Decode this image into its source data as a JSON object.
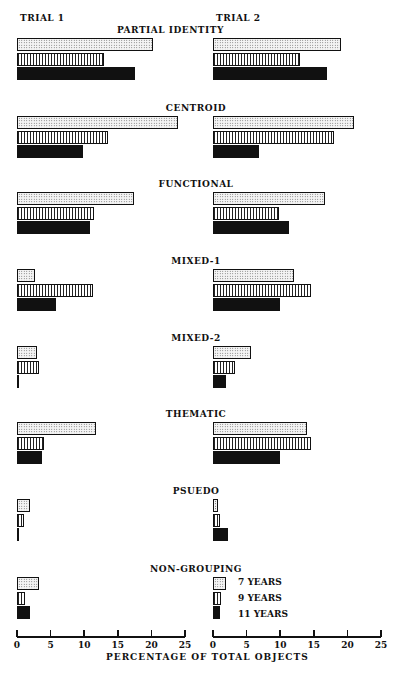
{
  "chart_data": {
    "type": "bar",
    "orientation": "horizontal",
    "panels": [
      "TRIAL 1",
      "TRIAL 2"
    ],
    "categories": [
      "PARTIAL IDENTITY",
      "CENTROID",
      "FUNCTIONAL",
      "MIXED-1",
      "MIXED-2",
      "THEMATIC",
      "PSUEDO",
      "NON-GROUPING"
    ],
    "series": [
      {
        "name": "7 YEARS",
        "pattern": "dotted",
        "trial1": [
          20.2,
          24.0,
          17.4,
          2.7,
          3.0,
          11.7,
          2.0,
          3.2
        ],
        "trial2": [
          19.0,
          21.0,
          16.7,
          12.0,
          5.6,
          14.0,
          0.8,
          2.0
        ]
      },
      {
        "name": "9 YEARS",
        "pattern": "vertical-lines",
        "trial1": [
          13.0,
          13.5,
          11.4,
          11.3,
          3.2,
          4.0,
          1.0,
          1.2
        ],
        "trial2": [
          13.0,
          18.0,
          9.8,
          14.6,
          3.2,
          14.6,
          1.0,
          1.2
        ]
      },
      {
        "name": "11 YEARS",
        "pattern": "solid-black",
        "trial1": [
          17.5,
          9.8,
          10.9,
          5.8,
          0.0,
          3.7,
          0.0,
          2.0
        ],
        "trial2": [
          17.0,
          6.8,
          11.3,
          9.9,
          2.0,
          10.0,
          2.2,
          1.0
        ]
      }
    ],
    "xlabel": "PERCENTAGE OF TOTAL OBJECTS",
    "xlim": [
      0,
      25
    ],
    "xticks": [
      0,
      5,
      10,
      15,
      20,
      25
    ],
    "legend": [
      "7 YEARS",
      "9 YEARS",
      "11 YEARS"
    ],
    "legend_position": "bottom-right",
    "grid": false
  },
  "labels": {
    "trial1": "TRIAL 1",
    "trial2": "TRIAL 2",
    "xlabel": "PERCENTAGE OF TOTAL OBJECTS",
    "ticks": [
      "0",
      "5",
      "10",
      "15",
      "20",
      "25"
    ],
    "legend": [
      "7 YEARS",
      "9 YEARS",
      "11 YEARS"
    ]
  }
}
